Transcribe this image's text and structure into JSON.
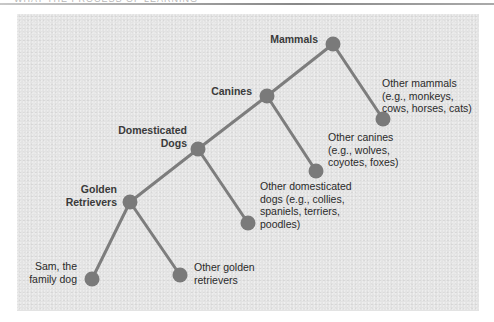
{
  "header": {
    "text": "WHAT THE PROCESS OF LEARNING"
  },
  "diagram": {
    "type": "hierarchy-tree",
    "colors": {
      "background": "#e3e3e3",
      "node": "#7a7a7a",
      "edge": "#7d7d7d",
      "text": "#2a2a2a"
    },
    "nodes": [
      {
        "id": "mammals",
        "label_lines": [
          "Mammals"
        ],
        "bold": true,
        "x": 333,
        "y": 44
      },
      {
        "id": "other-mammals",
        "label_lines": [
          "Other mammals",
          "(e.g., monkeys,",
          "cows, horses, cats)"
        ],
        "bold": false,
        "x": 383,
        "y": 119
      },
      {
        "id": "canines",
        "label_lines": [
          "Canines"
        ],
        "bold": true,
        "x": 267,
        "y": 96
      },
      {
        "id": "other-canines",
        "label_lines": [
          "Other canines",
          "(e.g., wolves,",
          "coyotes, foxes)"
        ],
        "bold": false,
        "x": 316,
        "y": 171
      },
      {
        "id": "domesticated-dogs",
        "label_lines": [
          "Domesticated",
          "Dogs"
        ],
        "bold": true,
        "x": 198,
        "y": 149
      },
      {
        "id": "other-domesticated-dogs",
        "label_lines": [
          "Other domesticated",
          "dogs (e.g., collies,",
          "spaniels, terriers,",
          "poodles)"
        ],
        "bold": false,
        "x": 248,
        "y": 223
      },
      {
        "id": "golden-retrievers",
        "label_lines": [
          "Golden",
          "Retrievers"
        ],
        "bold": true,
        "x": 130,
        "y": 202
      },
      {
        "id": "sam",
        "label_lines": [
          "Sam, the",
          "family dog"
        ],
        "bold": false,
        "x": 92,
        "y": 279
      },
      {
        "id": "other-golden-retrievers",
        "label_lines": [
          "Other golden",
          "retrievers"
        ],
        "bold": false,
        "x": 180,
        "y": 275
      }
    ],
    "edges": [
      [
        "mammals",
        "canines"
      ],
      [
        "mammals",
        "other-mammals"
      ],
      [
        "canines",
        "domesticated-dogs"
      ],
      [
        "canines",
        "other-canines"
      ],
      [
        "domesticated-dogs",
        "golden-retrievers"
      ],
      [
        "domesticated-dogs",
        "other-domesticated-dogs"
      ],
      [
        "golden-retrievers",
        "sam"
      ],
      [
        "golden-retrievers",
        "other-golden-retrievers"
      ]
    ]
  },
  "labels": {
    "mammals": {
      "l1": "Mammals"
    },
    "other_mammals": {
      "l1": "Other mammals",
      "l2": "(e.g., monkeys,",
      "l3": "cows, horses, cats)"
    },
    "canines": {
      "l1": "Canines"
    },
    "other_canines": {
      "l1": "Other canines",
      "l2": "(e.g., wolves,",
      "l3": "coyotes, foxes)"
    },
    "domesticated_dogs": {
      "l1": "Domesticated",
      "l2": "Dogs"
    },
    "other_domesticated_dogs": {
      "l1": "Other domesticated",
      "l2": "dogs (e.g., collies,",
      "l3": "spaniels, terriers,",
      "l4": "poodles)"
    },
    "golden_retrievers": {
      "l1": "Golden",
      "l2": "Retrievers"
    },
    "sam": {
      "l1": "Sam, the",
      "l2": "family dog"
    },
    "other_golden_retrievers": {
      "l1": "Other golden",
      "l2": "retrievers"
    }
  }
}
